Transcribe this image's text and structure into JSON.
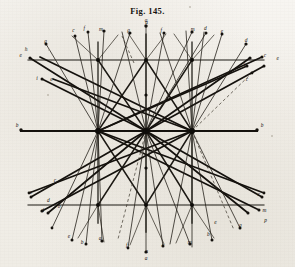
{
  "figure": {
    "title": "Fig. 145.",
    "caption_label": "Fig. 145.",
    "kind": "geometric-ray-lattice-engraving",
    "ink_color": "#14110d",
    "paper_color": "#f4f2ee"
  },
  "axis": {
    "left_label": "b",
    "right_label": "b",
    "top_label": "a",
    "bottom_label": "a"
  },
  "labels": [
    {
      "id": "t1",
      "text": "e",
      "x": 62,
      "y": 170
    },
    {
      "id": "t2",
      "text": "h",
      "x": 78,
      "y": 154
    },
    {
      "id": "t3",
      "text": "g",
      "x": 137,
      "y": 128
    },
    {
      "id": "t4",
      "text": "c",
      "x": 220,
      "y": 95
    },
    {
      "id": "t5",
      "text": "f",
      "x": 253,
      "y": 90
    },
    {
      "id": "t6",
      "text": "m",
      "x": 303,
      "y": 93
    },
    {
      "id": "t7",
      "text": "g",
      "x": 386,
      "y": 96
    },
    {
      "id": "t8",
      "text": "f",
      "x": 484,
      "y": 97
    },
    {
      "id": "t9",
      "text": "a",
      "x": 440,
      "y": 72
    },
    {
      "id": "t10",
      "text": "m",
      "x": 578,
      "y": 92
    },
    {
      "id": "t11",
      "text": "d",
      "x": 616,
      "y": 90
    },
    {
      "id": "t12",
      "text": "e",
      "x": 666,
      "y": 99
    },
    {
      "id": "t13",
      "text": "d",
      "x": 738,
      "y": 126
    },
    {
      "id": "t14",
      "text": "c",
      "x": 795,
      "y": 170
    },
    {
      "id": "t15",
      "text": "e",
      "x": 833,
      "y": 179
    },
    {
      "id": "t16",
      "text": "h",
      "x": 735,
      "y": 201
    },
    {
      "id": "t17",
      "text": "c",
      "x": 741,
      "y": 243
    },
    {
      "id": "t18",
      "text": "i",
      "x": 111,
      "y": 239
    },
    {
      "id": "t19",
      "text": "e",
      "x": 154,
      "y": 243
    },
    {
      "id": "t20",
      "text": "c",
      "x": 165,
      "y": 545
    },
    {
      "id": "t21",
      "text": "e",
      "x": 93,
      "y": 583
    },
    {
      "id": "t22",
      "text": "d",
      "x": 145,
      "y": 605
    },
    {
      "id": "t23",
      "text": "d",
      "x": 128,
      "y": 637
    },
    {
      "id": "t24",
      "text": "b",
      "x": 177,
      "y": 625
    },
    {
      "id": "t25",
      "text": "e",
      "x": 207,
      "y": 713
    },
    {
      "id": "t26",
      "text": "b",
      "x": 246,
      "y": 733
    },
    {
      "id": "t27",
      "text": "a",
      "x": 300,
      "y": 721
    },
    {
      "id": "t28",
      "text": "f",
      "x": 380,
      "y": 742
    },
    {
      "id": "t29",
      "text": "a",
      "x": 440,
      "y": 758
    },
    {
      "id": "t30",
      "text": "c",
      "x": 489,
      "y": 740
    },
    {
      "id": "t31",
      "text": "m",
      "x": 569,
      "y": 731
    },
    {
      "id": "t32",
      "text": "b",
      "x": 625,
      "y": 707
    },
    {
      "id": "t33",
      "text": "e",
      "x": 646,
      "y": 672
    },
    {
      "id": "t34",
      "text": "g",
      "x": 721,
      "y": 681
    },
    {
      "id": "t35",
      "text": "m",
      "x": 793,
      "y": 637
    },
    {
      "id": "t36",
      "text": "p",
      "x": 797,
      "y": 666
    },
    {
      "id": "t37",
      "text": "c",
      "x": 776,
      "y": 589
    }
  ],
  "nodes": {
    "hub_count": 3,
    "hub_radius": 2.6,
    "grid_node_radius": 1.7,
    "terminal_dot_radius": 1.5
  },
  "grid": {
    "vertical_x": [
      98,
      146,
      192
    ],
    "horizontal_y": [
      60,
      131,
      205
    ],
    "axis_extent_x": [
      20,
      258
    ]
  },
  "style": {
    "heavy_stroke": 1.55,
    "medium_stroke": 0.85,
    "light_stroke": 0.55,
    "dashed_pattern": "3,2.4"
  }
}
